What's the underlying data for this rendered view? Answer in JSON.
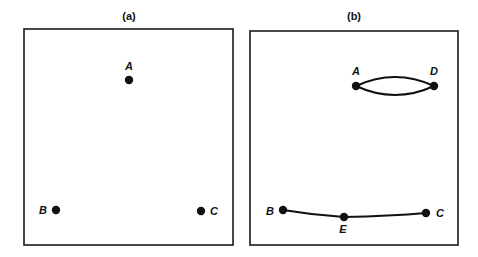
{
  "panels": [
    {
      "id": "a",
      "label": "(a)",
      "nodes": [
        {
          "name": "A",
          "label": "A"
        },
        {
          "name": "B",
          "label": "B"
        },
        {
          "name": "C",
          "label": "C"
        }
      ],
      "edges": []
    },
    {
      "id": "b",
      "label": "(b)",
      "nodes": [
        {
          "name": "A",
          "label": "A"
        },
        {
          "name": "D",
          "label": "D"
        },
        {
          "name": "B",
          "label": "B"
        },
        {
          "name": "E",
          "label": "E"
        },
        {
          "name": "C",
          "label": "C"
        }
      ],
      "edges": [
        {
          "from": "A",
          "to": "D",
          "style": "curve-upper"
        },
        {
          "from": "A",
          "to": "D",
          "style": "curve-lower"
        },
        {
          "from": "B",
          "to": "E"
        },
        {
          "from": "E",
          "to": "C"
        }
      ]
    }
  ]
}
